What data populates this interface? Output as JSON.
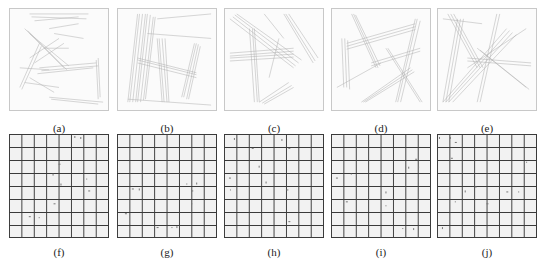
{
  "figure": {
    "top_row": [
      {
        "id": "a",
        "label": "(a)",
        "type": "stroke-sketch"
      },
      {
        "id": "b",
        "label": "(b)",
        "type": "stroke-sketch"
      },
      {
        "id": "c",
        "label": "(c)",
        "type": "stroke-sketch"
      },
      {
        "id": "d",
        "label": "(d)",
        "type": "stroke-sketch"
      },
      {
        "id": "e",
        "label": "(e)",
        "type": "stroke-sketch"
      }
    ],
    "bottom_row": [
      {
        "id": "f",
        "label": "(f)",
        "type": "grid",
        "rows": 8,
        "cols": 8
      },
      {
        "id": "g",
        "label": "(g)",
        "type": "grid",
        "rows": 8,
        "cols": 8
      },
      {
        "id": "h",
        "label": "(h)",
        "type": "grid",
        "rows": 8,
        "cols": 8
      },
      {
        "id": "i",
        "label": "(i)",
        "type": "grid",
        "rows": 8,
        "cols": 8
      },
      {
        "id": "j",
        "label": "(j)",
        "type": "grid",
        "rows": 8,
        "cols": 8
      }
    ],
    "colors": {
      "stroke": "#9a9a9a",
      "grid_line": "#3a3a3a",
      "cell_fill": "#f2f2f2"
    }
  }
}
